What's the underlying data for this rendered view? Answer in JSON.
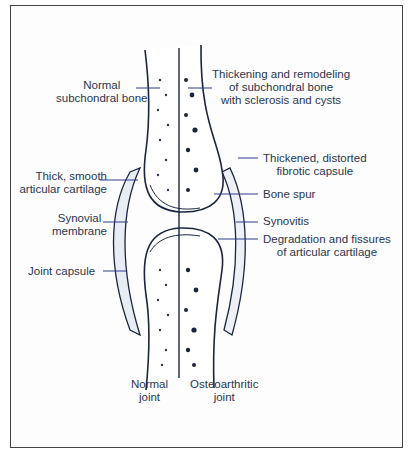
{
  "diagram": {
    "colors": {
      "ink": "#1a2540",
      "leader": "#2f3a8a",
      "frame": "#444444"
    },
    "labels": {
      "normal_subchondral": [
        "Normal",
        "subchondral bone"
      ],
      "thickening": [
        "Thickening and remodeling",
        "of subchondral bone",
        "with sclerosis and cysts"
      ],
      "thick_cartilage": [
        "Thick, smooth",
        "articular cartilage"
      ],
      "thickened_capsule": [
        "Thickened, distorted",
        "fibrotic capsule"
      ],
      "bone_spur": "Bone spur",
      "synovial": [
        "Synovial",
        "membrane"
      ],
      "synovitis": "Synovitis",
      "degradation": [
        "Degradation and fissures",
        "of articular cartilage"
      ],
      "joint_capsule": "Joint capsule",
      "normal_joint": [
        "Normal",
        "joint"
      ],
      "oa_joint": [
        "Osteoarthritic",
        "joint"
      ]
    }
  }
}
